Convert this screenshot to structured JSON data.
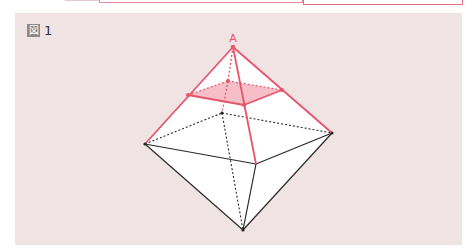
{
  "figure": {
    "label_glyph": "図",
    "label_number": "1",
    "vertex_label_top": "A",
    "colors": {
      "panel_bg": "#efe3e4",
      "highlight": "#e8546a",
      "section_fill": "#f5b8c2",
      "edge": "#2a2a2a",
      "face": "#ffffff"
    },
    "shape": "octahedron",
    "section": "horizontal cross-section near vertex A (shaded square)"
  }
}
